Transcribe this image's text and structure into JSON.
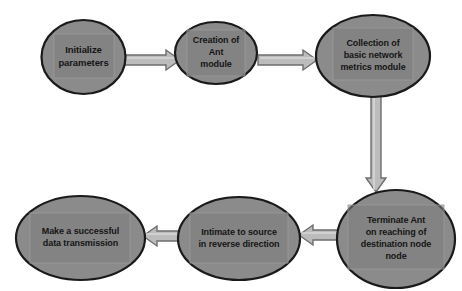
{
  "diagram": {
    "background_color": "#ffffff",
    "node_fill_color": "#8b8b8b",
    "node_stroke_color": "#1a1a1a",
    "node_inner_box_color": "#7e7e7e",
    "arrow_fill_color": "#bcbcbc",
    "arrow_stroke_color": "#6e6e6e",
    "text_color": "#151515"
  },
  "nodes": [
    {
      "id": "initialize-parameters",
      "label": "Initialize\nparameters",
      "shape": "ellipse",
      "cx": 83.5,
      "cy": 57,
      "rx": 42,
      "ry": 37,
      "font_size": 9.5,
      "box": {
        "x": 54,
        "y": 34,
        "w": 60,
        "h": 44
      }
    },
    {
      "id": "creation-of-ant-module",
      "label": "Creation of\nAnt\nmodule",
      "shape": "ellipse",
      "cx": 216,
      "cy": 53,
      "rx": 41,
      "ry": 31,
      "font_size": 9,
      "box": {
        "x": 187,
        "y": 30,
        "w": 58,
        "h": 46
      }
    },
    {
      "id": "collection-of-basic-network-metrics-module",
      "label": "Collection of\nbasic network\nmetrics module",
      "shape": "ellipse",
      "cx": 373,
      "cy": 56,
      "rx": 57,
      "ry": 41,
      "font_size": 9,
      "box": {
        "x": 333,
        "y": 28,
        "w": 80,
        "h": 52
      }
    },
    {
      "id": "terminate-ant-on-reaching-destination",
      "label": "Terminate Ant\non reaching of\ndestination node\nnode",
      "shape": "ellipse",
      "cx": 396,
      "cy": 239,
      "rx": 59,
      "ry": 49,
      "font_size": 9,
      "box": {
        "x": 348,
        "y": 205,
        "w": 96,
        "h": 64
      }
    },
    {
      "id": "intimate-to-source-in-reverse-direction",
      "label": "Intimate to source\nin reverse direction",
      "shape": "ellipse",
      "cx": 239,
      "cy": 238.5,
      "rx": 61,
      "ry": 41.5,
      "font_size": 9,
      "box": {
        "x": 190,
        "y": 213,
        "w": 98,
        "h": 50
      }
    },
    {
      "id": "make-a-successful-data-transmission",
      "label": "Make a successful\ndata transmission",
      "shape": "ellipse",
      "cx": 80.5,
      "cy": 238,
      "rx": 64.5,
      "ry": 42,
      "font_size": 9,
      "box": {
        "x": 30,
        "y": 213,
        "w": 100,
        "h": 50
      }
    }
  ],
  "arrows": [
    {
      "id": "arrow-initialize-to-creation",
      "from": "initialize-parameters",
      "to": "creation-of-ant-module",
      "direction": "right",
      "x1": 124,
      "y1": 60,
      "x2": 180,
      "y2": 60,
      "shaft_half": 5,
      "head_half": 10,
      "head_len": 14
    },
    {
      "id": "arrow-creation-to-collection",
      "from": "creation-of-ant-module",
      "to": "collection-of-basic-network-metrics-module",
      "direction": "right",
      "x1": 258,
      "y1": 60,
      "x2": 317,
      "y2": 60,
      "shaft_half": 5,
      "head_half": 10,
      "head_len": 14
    },
    {
      "id": "arrow-collection-to-terminate",
      "from": "collection-of-basic-network-metrics-module",
      "to": "terminate-ant-on-reaching-destination",
      "direction": "down",
      "x1": 376,
      "y1": 95,
      "x2": 376,
      "y2": 192,
      "shaft_half": 5,
      "head_half": 10,
      "head_len": 14
    },
    {
      "id": "arrow-terminate-to-intimate",
      "from": "terminate-ant-on-reaching-destination",
      "to": "intimate-to-source-in-reverse-direction",
      "direction": "left",
      "x1": 338,
      "y1": 235,
      "x2": 299,
      "y2": 235,
      "shaft_half": 5,
      "head_half": 10,
      "head_len": 14
    },
    {
      "id": "arrow-intimate-to-transmission",
      "from": "intimate-to-source-in-reverse-direction",
      "to": "make-a-successful-data-transmission",
      "direction": "left",
      "x1": 181,
      "y1": 236,
      "x2": 143,
      "y2": 236,
      "shaft_half": 5,
      "head_half": 10,
      "head_len": 14
    }
  ]
}
